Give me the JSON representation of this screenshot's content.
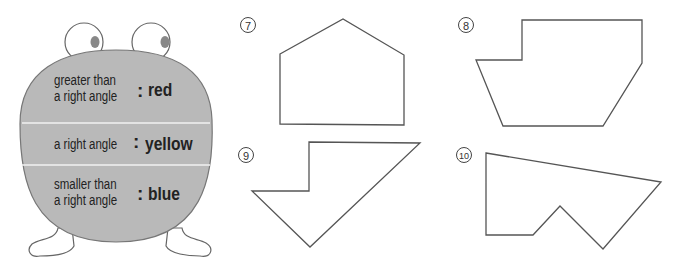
{
  "legend": {
    "rows": [
      {
        "label_line1": "greater than",
        "label_line2": "a right angle",
        "color": "red"
      },
      {
        "label_line1": "a right angle",
        "label_line2": "",
        "color": "yellow"
      },
      {
        "label_line1": "smaller than",
        "label_line2": "a right angle",
        "color": "blue"
      }
    ],
    "separator": ":"
  },
  "shapes": [
    {
      "number": "7",
      "points": "280,54 343,19 404,55 404,125 280,124"
    },
    {
      "number": "8",
      "points": "522,20 642,20 642,63 603,126 503,126 476,60 522,60"
    },
    {
      "number": "9",
      "points": "309,142 420,143 310,247 252,191 309,191"
    },
    {
      "number": "10",
      "points": "486,153 661,182 603,249 560,206 533,235 486,235"
    }
  ],
  "colors": {
    "body": "#b9b9b9",
    "stroke": "#555555"
  }
}
